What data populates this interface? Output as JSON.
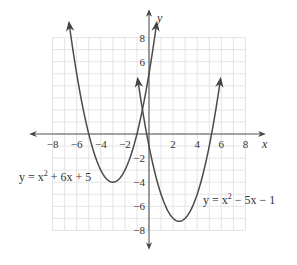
{
  "chart_data": {
    "type": "line",
    "title": "",
    "xlabel": "x",
    "ylabel": "y",
    "xlim": [
      -8,
      8
    ],
    "ylim": [
      -8,
      8
    ],
    "grid": true,
    "grid_step": 1,
    "x_ticks": [
      -8,
      -6,
      -4,
      -2,
      2,
      4,
      6,
      8
    ],
    "y_ticks": [
      8,
      6,
      -2,
      -4,
      -6,
      -8
    ],
    "x_tick_labels": [
      "−8",
      "−6",
      "−4",
      "−2",
      "2",
      "4",
      "6",
      "8"
    ],
    "y_tick_labels": [
      "8",
      "6",
      "−2",
      "−4",
      "−6",
      "−8"
    ],
    "series": [
      {
        "name": "y = x² + 6x + 5",
        "equation": {
          "a": 1,
          "b": 6,
          "c": 5
        },
        "vertex": [
          -3,
          -4
        ],
        "x_intercepts": [
          -5,
          -1
        ],
        "y_intercept": 5,
        "x_range": [
          -6.6,
          0.6
        ]
      },
      {
        "name": "y = x² − 5x − 1",
        "equation": {
          "a": 1,
          "b": -5,
          "c": -1
        },
        "vertex": [
          2.5,
          -7.25
        ],
        "x_intercepts": [
          -0.19,
          5.19
        ],
        "y_intercept": -1,
        "x_range": [
          -0.9,
          5.9
        ]
      }
    ],
    "annotations": [
      {
        "text": "y = x² + 6x + 5",
        "near": [
          -8.5,
          -3.5
        ]
      },
      {
        "text": "y = x² − 5x − 1",
        "near": [
          4.5,
          -5.5
        ]
      }
    ]
  },
  "labels": {
    "x_axis": "x",
    "y_axis": "y",
    "eq1_prefix": "y = x",
    "eq1_exp": "2",
    "eq1_suffix": " + 6x + 5",
    "eq2_prefix": "y = x",
    "eq2_exp": "2",
    "eq2_suffix": " − 5x − 1"
  }
}
